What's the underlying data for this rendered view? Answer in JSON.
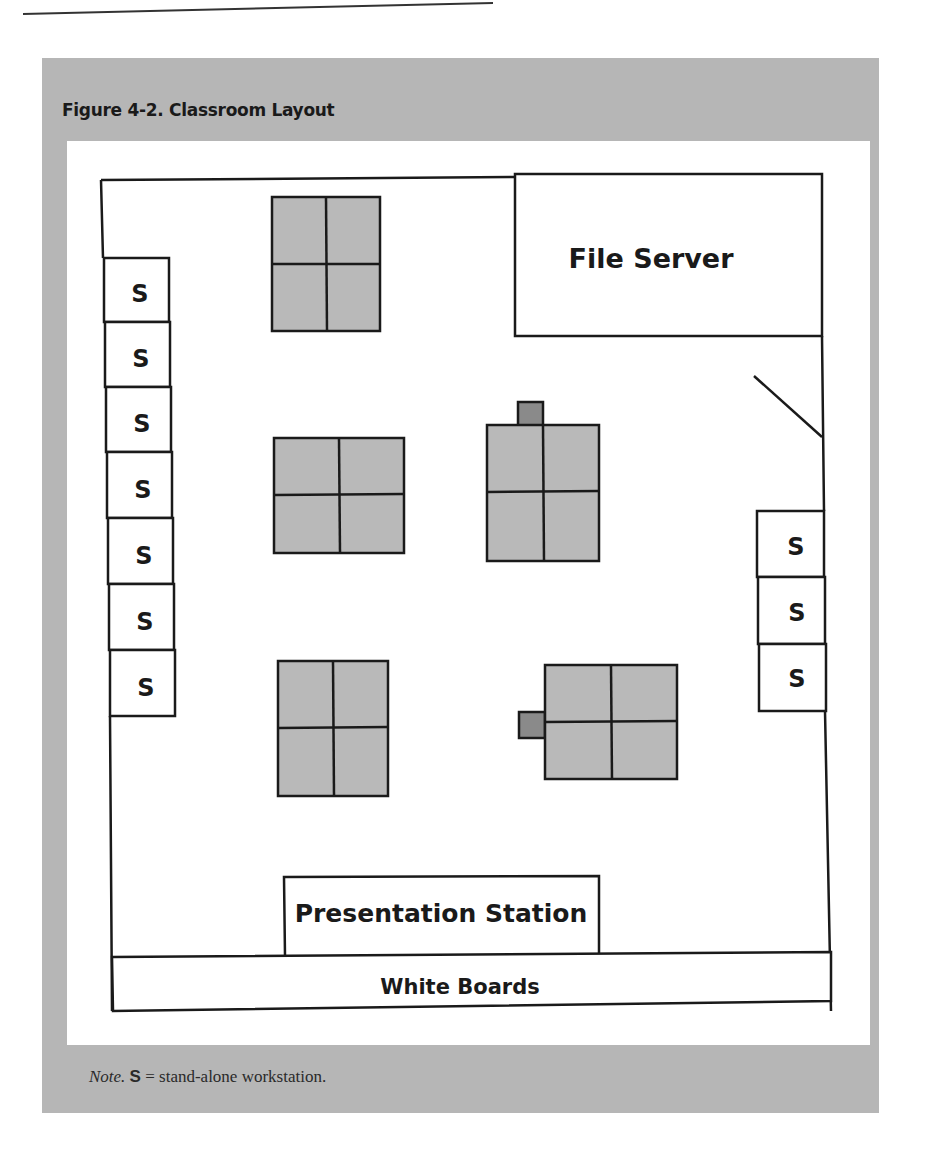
{
  "figure": {
    "title": "Figure 4-2. Classroom Layout",
    "note_prefix": "Note.",
    "note_symbol": "S",
    "note_text": " = stand-alone workstation."
  },
  "labels": {
    "file_server": "File Server",
    "presentation_station": "Presentation Station",
    "white_boards": "White Boards",
    "workstation": "S"
  },
  "colors": {
    "panel": "#b6b6b6",
    "table_fill": "#b9b9b9",
    "table_accessory": "#8a8a8a",
    "line": "#1a1a1a"
  },
  "left_workstations": [
    "S",
    "S",
    "S",
    "S",
    "S",
    "S",
    "S"
  ],
  "right_workstations": [
    "S",
    "S",
    "S"
  ],
  "table_clusters": [
    {
      "id": "table-cluster-1",
      "seats": 4,
      "has_accessory": false
    },
    {
      "id": "table-cluster-2",
      "seats": 4,
      "has_accessory": false
    },
    {
      "id": "table-cluster-3",
      "seats": 4,
      "has_accessory": true,
      "accessory_side": "top"
    },
    {
      "id": "table-cluster-4",
      "seats": 4,
      "has_accessory": false
    },
    {
      "id": "table-cluster-5",
      "seats": 4,
      "has_accessory": true,
      "accessory_side": "left"
    }
  ]
}
